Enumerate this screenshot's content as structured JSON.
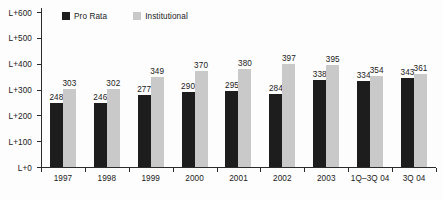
{
  "chart_data": {
    "type": "bar",
    "title": "",
    "xlabel": "",
    "ylabel": "",
    "grid": false,
    "legend_position": "top-left",
    "categories": [
      "1997",
      "1998",
      "1999",
      "2000",
      "2001",
      "2002",
      "2003",
      "1Q–3Q 04",
      "3Q 04"
    ],
    "ylim": [
      0,
      600
    ],
    "ytick_labels": [
      "L+600",
      "L+500",
      "L+400",
      "L+300",
      "L+200",
      "L+100",
      "L+0"
    ],
    "ytick_values": [
      600,
      500,
      400,
      300,
      200,
      100,
      0
    ],
    "series": [
      {
        "name": "Pro Rata",
        "color": "#1d1d1d",
        "values": [
          248,
          246,
          277,
          290,
          295,
          284,
          338,
          334,
          343
        ]
      },
      {
        "name": "Institutional",
        "color": "#c9c9c9",
        "values": [
          303,
          302,
          349,
          370,
          380,
          397,
          395,
          354,
          361
        ]
      }
    ]
  },
  "legend": {
    "entries": [
      {
        "label": "Pro Rata",
        "color": "#1d1d1d"
      },
      {
        "label": "Institutional",
        "color": "#c9c9c9"
      }
    ]
  }
}
